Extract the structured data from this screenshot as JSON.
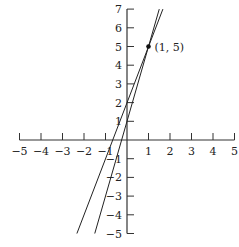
{
  "chart_data": {
    "type": "line",
    "title": "",
    "xlabel": "",
    "ylabel": "",
    "xlim": [
      -5,
      5
    ],
    "ylim": [
      -5,
      7
    ],
    "grid": false,
    "x_ticks": [
      "-5",
      "-4",
      "-3",
      "-2",
      "-1",
      "1",
      "2",
      "3",
      "4",
      "5"
    ],
    "y_ticks": [
      "7",
      "6",
      "5",
      "4",
      "3",
      "2",
      "1",
      "-1",
      "-2",
      "-3",
      "-4",
      "-5"
    ],
    "series": [
      {
        "name": "line-a",
        "equation": "y = 3x + 2",
        "slope": 3,
        "intercept": 2,
        "x": [
          -2.33,
          1.67
        ],
        "y": [
          -5,
          7
        ]
      },
      {
        "name": "line-b",
        "equation": "y = 4x + 1",
        "slope": 4,
        "intercept": 1,
        "x": [
          -1.5,
          1.5
        ],
        "y": [
          -5,
          7
        ]
      }
    ],
    "annotations": [
      {
        "point": [
          1,
          5
        ],
        "label": "(1, 5)"
      }
    ]
  },
  "labels": {
    "point": "(1, 5)"
  }
}
